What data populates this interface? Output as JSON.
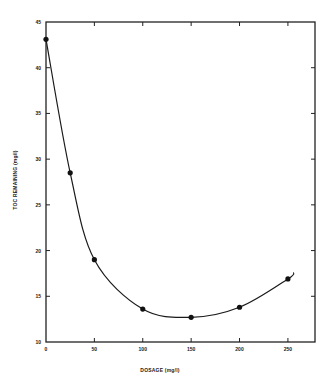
{
  "chart_data": {
    "type": "line",
    "title": "",
    "xlabel": "DOSAGE (mg/l)",
    "ylabel": "TOC REMAINING (mg/l)",
    "xlim": [
      0,
      278
    ],
    "ylim": [
      10,
      45
    ],
    "x_ticks": [
      0,
      50,
      100,
      150,
      200,
      250
    ],
    "y_ticks": [
      10,
      15,
      20,
      25,
      30,
      35,
      40,
      45
    ],
    "x_tick_labels": [
      "0",
      "50",
      "100",
      "150",
      "200",
      "250"
    ],
    "y_tick_labels": [
      "10",
      "15",
      "20",
      "25",
      "30",
      "35",
      "40",
      "45"
    ],
    "grid": false,
    "legend": null,
    "series": [
      {
        "name": "TOC remaining",
        "style": "markers with smooth fitted curve",
        "x": [
          0,
          25,
          50,
          100,
          150,
          200,
          250
        ],
        "y": [
          43.1,
          28.5,
          19.0,
          13.6,
          12.7,
          13.8,
          16.9
        ]
      }
    ],
    "curve_end": {
      "x": 256,
      "y": 17.6
    },
    "colors": {
      "line": "#1a1a1a",
      "marker": "#111111",
      "frame": "#222222"
    }
  }
}
